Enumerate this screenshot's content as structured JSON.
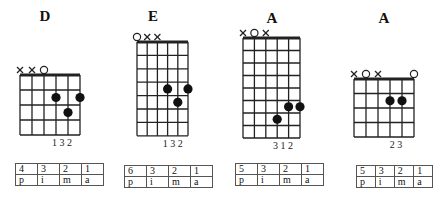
{
  "chords": [
    {
      "name": "D",
      "title_x": 45,
      "title_y": 8,
      "grid": {
        "left": 20,
        "top": 75,
        "width": 60,
        "frets": 4,
        "fret_h": 15
      },
      "markers": [
        "x",
        "x",
        "o",
        "",
        "",
        ""
      ],
      "dots": [
        {
          "string": 4,
          "fret": 2
        },
        {
          "string": 6,
          "fret": 2
        },
        {
          "string": 5,
          "fret": 3
        }
      ],
      "fingering": "1 3 2",
      "table": {
        "left": 15,
        "top": 163,
        "strings": [
          "4",
          "3",
          "2",
          "1"
        ],
        "fingers": [
          "p",
          "i",
          "m",
          "a"
        ]
      }
    },
    {
      "name": "E",
      "title_x": 153,
      "title_y": 8,
      "grid": {
        "left": 137,
        "top": 42,
        "width": 51,
        "frets": 7,
        "fret_h": 13.4
      },
      "markers": [
        "o",
        "x",
        "x",
        "",
        "",
        ""
      ],
      "dots": [
        {
          "string": 4,
          "fret": 4
        },
        {
          "string": 6,
          "fret": 4
        },
        {
          "string": 5,
          "fret": 5
        }
      ],
      "fingering": "1 3 2",
      "table": {
        "left": 124,
        "top": 165,
        "strings": [
          "6",
          "3",
          "2",
          "1"
        ],
        "fingers": [
          "p",
          "i",
          "m",
          "a"
        ]
      }
    },
    {
      "name": "A",
      "title_x": 272,
      "title_y": 10,
      "grid": {
        "left": 243,
        "top": 38,
        "width": 57,
        "frets": 8,
        "fret_h": 12.5
      },
      "markers": [
        "x",
        "o",
        "x",
        "",
        "",
        ""
      ],
      "dots": [
        {
          "string": 5,
          "fret": 6
        },
        {
          "string": 6,
          "fret": 6
        },
        {
          "string": 4,
          "fret": 7
        }
      ],
      "fingering": "3 1 2",
      "table": {
        "left": 235,
        "top": 163,
        "strings": [
          "5",
          "3",
          "2",
          "1"
        ],
        "fingers": [
          "p",
          "i",
          "m",
          "a"
        ]
      }
    },
    {
      "name": "A",
      "title_x": 384,
      "title_y": 10,
      "grid": {
        "left": 354,
        "top": 79,
        "width": 60,
        "frets": 4,
        "fret_h": 14.5
      },
      "markers": [
        "x",
        "o",
        "x",
        "",
        "",
        "o"
      ],
      "dots": [
        {
          "string": 4,
          "fret": 2
        },
        {
          "string": 5,
          "fret": 2
        }
      ],
      "fingering": "2 3",
      "table": {
        "left": 356,
        "top": 165,
        "strings": [
          "5",
          "3",
          "2",
          "1"
        ],
        "fingers": [
          "p",
          "i",
          "m",
          "a"
        ]
      }
    }
  ]
}
